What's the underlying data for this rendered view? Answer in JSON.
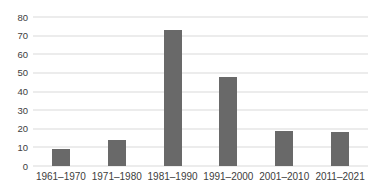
{
  "chart_data": {
    "type": "bar",
    "title": "",
    "xlabel": "",
    "ylabel": "",
    "categories": [
      "1961–1970",
      "1971–1980",
      "1981–1990",
      "1991–2000",
      "2001–2010",
      "2011–2021"
    ],
    "values": [
      9,
      14,
      73,
      48,
      19,
      18
    ],
    "ylim": [
      0,
      80
    ],
    "yticks": [
      0,
      10,
      20,
      30,
      40,
      50,
      60,
      70,
      80
    ],
    "grid": "horizontal",
    "legend_position": "none",
    "bar_color": "#696969",
    "gridline_color": "#d9d9d9",
    "label_color": "#404040",
    "background_color": "#ffffff"
  }
}
